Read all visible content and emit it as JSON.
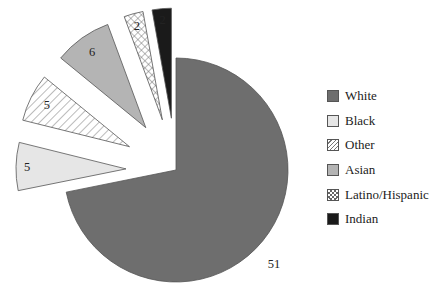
{
  "chart_data": {
    "type": "pie",
    "title": "",
    "exploded": true,
    "categories": [
      "White",
      "Black",
      "Other",
      "Asian",
      "Latino/Hispanic",
      "Indian"
    ],
    "values": [
      51,
      5,
      5,
      6,
      2,
      2
    ],
    "data_labels": [
      "51",
      "5",
      "5",
      "6",
      "2",
      "2"
    ],
    "fills": [
      {
        "name": "White",
        "color": "#6e6e6e",
        "pattern": "solid"
      },
      {
        "name": "Black",
        "color": "#e6e6e6",
        "pattern": "solid"
      },
      {
        "name": "Other",
        "color": "#ffffff",
        "pattern": "diagonal-hatch"
      },
      {
        "name": "Asian",
        "color": "#b4b4b4",
        "pattern": "solid"
      },
      {
        "name": "Latino/Hispanic",
        "color": "#ffffff",
        "pattern": "crosshatch"
      },
      {
        "name": "Indian",
        "color": "#1a1a1a",
        "pattern": "solid"
      }
    ],
    "legend_position": "right"
  },
  "legend": {
    "items": [
      {
        "label": "White"
      },
      {
        "label": "Black"
      },
      {
        "label": "Other"
      },
      {
        "label": "Asian"
      },
      {
        "label": "Latino/Hispanic"
      },
      {
        "label": "Indian"
      }
    ]
  },
  "slice_labels": {
    "white": "51",
    "black": "5",
    "other": "5",
    "asian": "6",
    "latino": "2",
    "indian": "2"
  }
}
